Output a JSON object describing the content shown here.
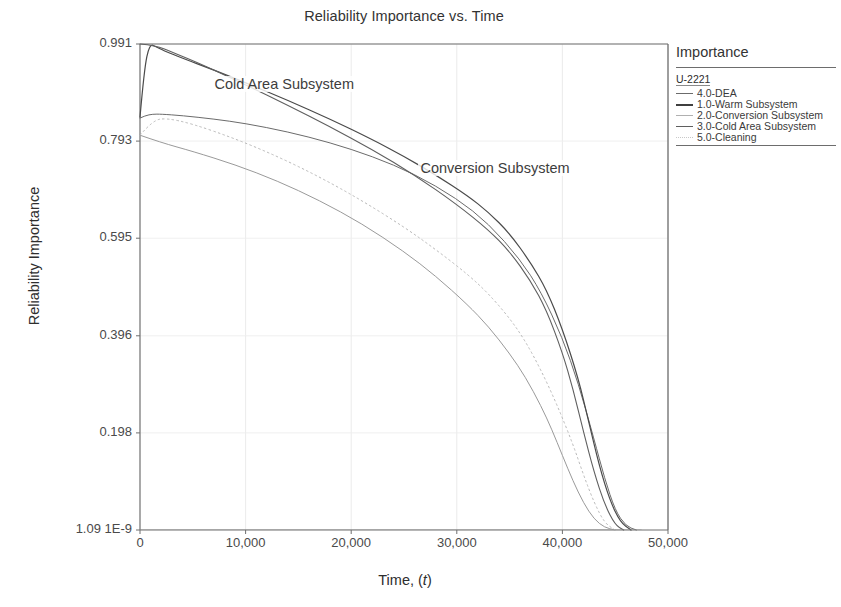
{
  "chart_data": {
    "type": "line",
    "title": "Reliability Importance vs. Time",
    "xlabel": "Time, (t)",
    "ylabel": "Reliability Importance",
    "grid": true,
    "legend_position": "right-outside",
    "xlim": [
      0,
      50000
    ],
    "ylim": [
      1.09e-09,
      0.991
    ],
    "xticks": [
      0,
      10000,
      20000,
      30000,
      40000,
      50000
    ],
    "xtick_labels": [
      "0",
      "10,000",
      "20,000",
      "30,000",
      "40,000",
      "50,000"
    ],
    "ytick_labels": [
      "0.991",
      "0.793",
      "0.595",
      "0.396",
      "0.198",
      "1.09 1E-9"
    ],
    "ytick_values": [
      0.991,
      0.793,
      0.595,
      0.396,
      0.198,
      0.0
    ],
    "annotations": [
      {
        "text": "Cold Area Subsystem",
        "x": 13500,
        "y": 0.905
      },
      {
        "text": "Conversion Subsystem",
        "x": 33000,
        "y": 0.735
      }
    ],
    "series": [
      {
        "name": "4.0-DEA",
        "color": "#6b6b6b",
        "style": "solid",
        "width": 1.0,
        "x": [
          0,
          500,
          1200,
          2000,
          4000,
          7000,
          10000,
          14000,
          18000,
          22000,
          26000,
          30000,
          33000,
          36000,
          38000,
          40000,
          41500,
          43000,
          44000,
          45000,
          46000,
          47000
        ],
        "y": [
          0.84,
          0.845,
          0.848,
          0.848,
          0.845,
          0.838,
          0.829,
          0.812,
          0.79,
          0.762,
          0.726,
          0.676,
          0.625,
          0.552,
          0.485,
          0.392,
          0.3,
          0.185,
          0.105,
          0.04,
          0.008,
          0.0
        ]
      },
      {
        "name": "1.0-Warm Subsystem",
        "color": "#4a4a4a",
        "style": "solid",
        "width": 1.2,
        "x": [
          0,
          400,
          900,
          1500,
          2200,
          4000,
          7000,
          10000,
          14000,
          18000,
          22000,
          25000,
          28000,
          31000,
          33000,
          35000,
          37000,
          38500,
          40000,
          41500,
          42500,
          43500,
          44500,
          45500,
          46500
        ],
        "y": [
          0.842,
          0.94,
          0.991,
          0.986,
          0.978,
          0.962,
          0.938,
          0.912,
          0.876,
          0.838,
          0.796,
          0.762,
          0.724,
          0.682,
          0.648,
          0.605,
          0.545,
          0.49,
          0.41,
          0.31,
          0.22,
          0.13,
          0.06,
          0.015,
          0.0
        ]
      },
      {
        "name": "2.0-Conversion Subsystem",
        "color": "#9a9a9a",
        "style": "solid",
        "width": 1.0,
        "x": [
          0,
          2000,
          5000,
          9000,
          13000,
          17000,
          21000,
          25000,
          28000,
          31000,
          33000,
          35000,
          36500,
          38000,
          39000,
          40000,
          41000,
          42000,
          43000,
          44000,
          45000
        ],
        "y": [
          0.805,
          0.79,
          0.772,
          0.745,
          0.712,
          0.672,
          0.625,
          0.568,
          0.518,
          0.46,
          0.415,
          0.36,
          0.312,
          0.252,
          0.205,
          0.152,
          0.1,
          0.055,
          0.022,
          0.005,
          0.0
        ]
      },
      {
        "name": "3.0-Cold Area Subsystem",
        "color": "#5f5f5f",
        "style": "solid",
        "width": 1.1,
        "x": [
          0,
          1500,
          3000,
          6000,
          10000,
          14000,
          18000,
          22000,
          26000,
          30000,
          33000,
          35000,
          37000,
          38500,
          40000,
          41000,
          42000,
          43000,
          44000,
          45000,
          45800
        ],
        "y": [
          0.991,
          0.988,
          0.975,
          0.948,
          0.908,
          0.866,
          0.822,
          0.776,
          0.724,
          0.664,
          0.612,
          0.568,
          0.508,
          0.448,
          0.362,
          0.288,
          0.2,
          0.118,
          0.052,
          0.01,
          0.0
        ]
      },
      {
        "name": "5.0-Cleaning",
        "color": "#b9b9b9",
        "style": "dotted",
        "width": 1.0,
        "x": [
          0,
          1200,
          2500,
          5000,
          9000,
          13000,
          17000,
          21000,
          25000,
          28000,
          31000,
          33000,
          35000,
          36500,
          38000,
          39500,
          41000,
          42000,
          43000,
          44000,
          45000
        ],
        "y": [
          0.805,
          0.835,
          0.84,
          0.828,
          0.798,
          0.762,
          0.72,
          0.672,
          0.618,
          0.572,
          0.522,
          0.482,
          0.432,
          0.385,
          0.325,
          0.255,
          0.175,
          0.112,
          0.056,
          0.014,
          0.0
        ]
      }
    ]
  },
  "legend": {
    "title": "Importance",
    "group_label": "U-2221",
    "entries": [
      {
        "label": "4.0-DEA",
        "color": "#6b6b6b",
        "style": "solid"
      },
      {
        "label": "1.0-Warm Subsystem",
        "color": "#3f3f3f",
        "style": "solid"
      },
      {
        "label": "2.0-Conversion Subsystem",
        "color": "#b0b0b0",
        "style": "solid"
      },
      {
        "label": "3.0-Cold Area Subsystem",
        "color": "#5f5f5f",
        "style": "solid"
      },
      {
        "label": "5.0-Cleaning",
        "color": "#c8c8c8",
        "style": "dotted"
      }
    ]
  },
  "plot_geometry": {
    "left": 140,
    "right": 668,
    "top": 44,
    "bottom": 530
  }
}
